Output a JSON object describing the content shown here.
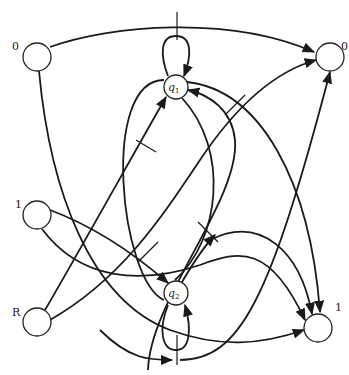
{
  "diagram": {
    "type": "state-transition network",
    "inputs": [
      {
        "id": "in0",
        "label": "0"
      },
      {
        "id": "in1",
        "label": "1"
      },
      {
        "id": "inR",
        "label": "R"
      }
    ],
    "states": [
      {
        "id": "q1",
        "label": "q",
        "subscript": "1"
      },
      {
        "id": "q2",
        "label": "q",
        "subscript": "2"
      }
    ],
    "outputs": [
      {
        "id": "out0",
        "label": "0"
      },
      {
        "id": "out1",
        "label": "1"
      }
    ],
    "edges": [
      {
        "from": "in0",
        "to": "out0",
        "inhibited": true
      },
      {
        "from": "in0",
        "to": "out1",
        "inhibited": true
      },
      {
        "from": "in1",
        "to": "q2",
        "inhibited": true
      },
      {
        "from": "in1",
        "to": "out1"
      },
      {
        "from": "inR",
        "to": "q1"
      },
      {
        "from": "inR",
        "to": "out0"
      },
      {
        "from": "q1",
        "to": "q1",
        "inhibited": true
      },
      {
        "from": "q1",
        "to": "q2",
        "inhibited": true
      },
      {
        "from": "q1",
        "to": "out1"
      },
      {
        "from": "q2",
        "to": "q2",
        "inhibited": true
      },
      {
        "from": "q2",
        "to": "q1",
        "inhibited": true
      },
      {
        "from": "q2",
        "to": "out0"
      },
      {
        "from": "q2",
        "to": "out1",
        "inhibited": true
      }
    ]
  }
}
